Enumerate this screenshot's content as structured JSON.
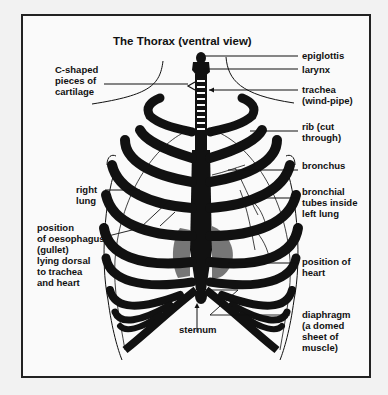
{
  "diagram": {
    "title": "The Thorax (ventral view)",
    "labels": {
      "epiglottis": "epiglottis",
      "larynx": "larynx",
      "trachea": "trachea\n(wind-pipe)",
      "c_shaped": "C-shaped\npieces of\ncartilage",
      "rib": "rib (cut\nthrough)",
      "bronchus": "bronchus",
      "bronchial_tubes": "bronchial\ntubes inside\nleft lung",
      "right_lung": "right\nlung",
      "oesophagus": "position\nof oesophagus\n(gullet)\nlying dorsal\nto trachea\nand heart",
      "heart": "position of\nheart",
      "diaphragm": "diaphragm\n(a domed\nsheet of\nmuscle)",
      "sternum": "sternum"
    },
    "colors": {
      "ink": "#111111",
      "background": "#fafafa",
      "page": "#f2f2f2",
      "heart_shade": "#555555"
    }
  }
}
